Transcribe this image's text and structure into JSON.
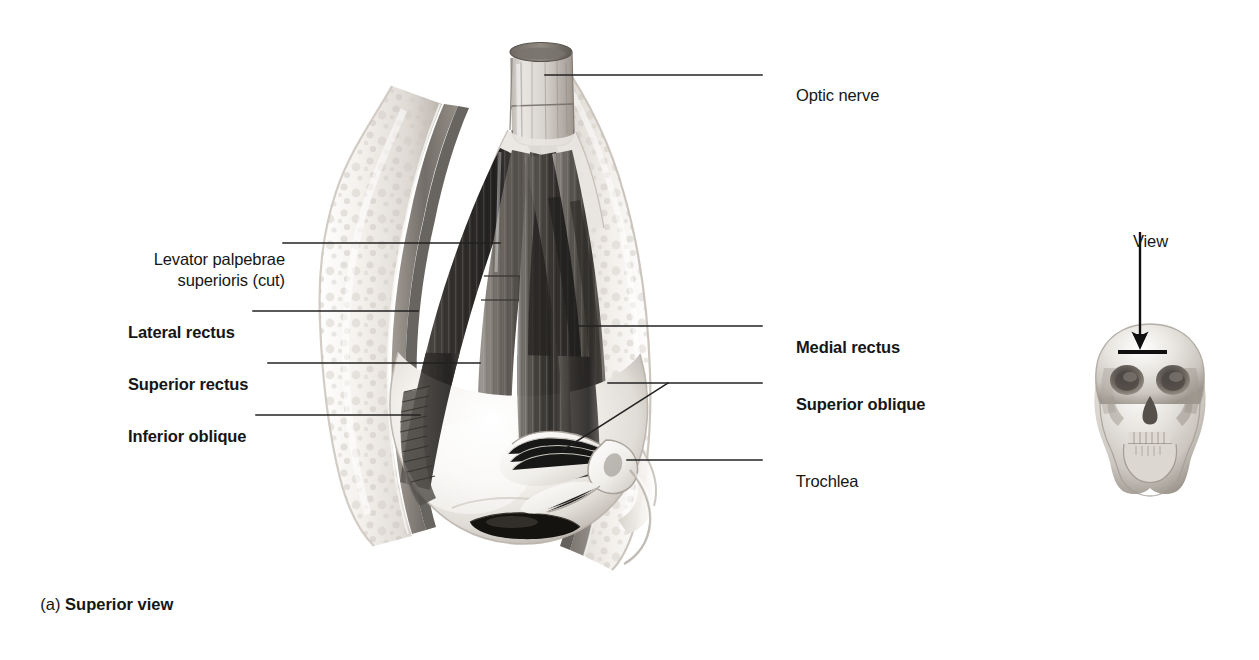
{
  "figure": {
    "caption_letter": "(a) ",
    "caption_text": "Superior view"
  },
  "labels_left": [
    {
      "id": "levator-palpebrae-superioris",
      "text": "Levator palpebrae\nsuperioris (cut)",
      "bold": false,
      "x": 110,
      "y": 228
    },
    {
      "id": "lateral-rectus",
      "text": "Lateral rectus",
      "bold": true,
      "x": 110,
      "y": 301
    },
    {
      "id": "superior-rectus",
      "text": "Superior rectus",
      "bold": true,
      "x": 110,
      "y": 353
    },
    {
      "id": "inferior-oblique",
      "text": "Inferior oblique",
      "bold": true,
      "x": 110,
      "y": 405
    }
  ],
  "labels_right": [
    {
      "id": "optic-nerve",
      "text": "Optic nerve",
      "bold": false,
      "x": 778,
      "y": 64
    },
    {
      "id": "medial-rectus",
      "text": "Medial rectus",
      "bold": true,
      "x": 778,
      "y": 316
    },
    {
      "id": "superior-oblique",
      "text": "Superior oblique",
      "bold": true,
      "x": 778,
      "y": 373
    },
    {
      "id": "trochlea",
      "text": "Trochlea",
      "bold": false,
      "x": 778,
      "y": 450
    }
  ],
  "inset": {
    "view_label": "View",
    "view_label_x": 1115,
    "view_label_y": 210
  },
  "leaders": [
    {
      "id": "leader-levator",
      "points": "283,243 500,243"
    },
    {
      "id": "leader-lateral-rectus",
      "points": "253,311 418,311"
    },
    {
      "id": "leader-superior-rectus",
      "points": "268,363 480,363"
    },
    {
      "id": "leader-inferior-oblique",
      "points": "256,415 420,415"
    },
    {
      "id": "leader-optic-nerve",
      "points": "545,75 762,75"
    },
    {
      "id": "leader-medial-rectus",
      "points": "575,326 762,326"
    },
    {
      "id": "leader-superior-oblique",
      "points": "608,383 762,383"
    },
    {
      "id": "leader-superior-oblique-tendon",
      "points": "563,450 668,383"
    },
    {
      "id": "leader-trochlea",
      "points": "627,460 762,460"
    },
    {
      "id": "leader-view-arrow",
      "points": "1140,232 1140,344"
    }
  ],
  "colors": {
    "ink": "#161616",
    "leader": "#2b2b2b",
    "background": "#ffffff",
    "bone_light": "#efece8",
    "bone_mid": "#cfcac4",
    "muscle_dark": "#3a3a3a",
    "muscle_mid": "#6f6f6f",
    "sclera": "#f4f2ef"
  }
}
